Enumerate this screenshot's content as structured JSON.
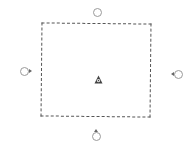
{
  "canvas": {
    "background": "#ffffff",
    "width": 191,
    "height": 152
  },
  "selection": {
    "shape": "rectangle",
    "style": "dashed",
    "stroke_color": "#555555",
    "bounds": {
      "left": 41,
      "top": 23,
      "right": 151,
      "bottom": 117
    }
  },
  "handles": [
    {
      "name": "top",
      "x": 97,
      "y": 12,
      "pointer": "none"
    },
    {
      "name": "left",
      "x": 24,
      "y": 71,
      "pointer": "right"
    },
    {
      "name": "right",
      "x": 177,
      "y": 74,
      "pointer": "left"
    },
    {
      "name": "bottom",
      "x": 96,
      "y": 136,
      "pointer": "up"
    }
  ],
  "center_anchor": {
    "icon": "anchor-pin-icon",
    "color": "#444444",
    "x": 98,
    "y": 74
  },
  "colors": {
    "handle_stroke": "#9a9a9a",
    "dash_stroke": "#555555",
    "anchor_fill": "#444444"
  }
}
